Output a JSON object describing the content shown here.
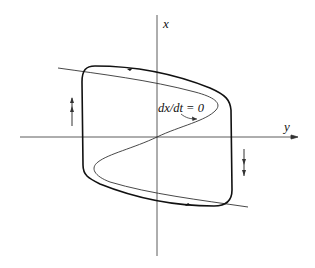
{
  "figure": {
    "type": "phase-plane",
    "axes": {
      "vertical_label": "x",
      "horizontal_label": "y"
    },
    "nullcline_label": "dx/dt = 0",
    "flow_arrows": [
      {
        "side": "left",
        "direction": "up"
      },
      {
        "side": "right",
        "direction": "down"
      }
    ],
    "colors": {
      "stroke": "#222222",
      "background": "#ffffff"
    }
  }
}
